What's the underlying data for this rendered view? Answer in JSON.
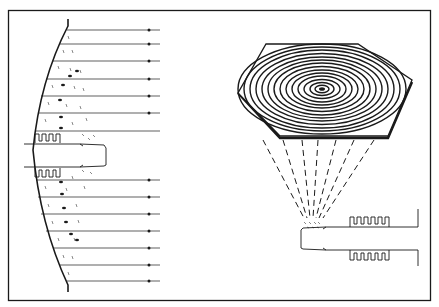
{
  "figure": {
    "type": "technical-illustration",
    "colors": {
      "ink": "#1a1a1a",
      "background": "#ffffff"
    },
    "left_panel": {
      "parallel_ray_count_upper": 7,
      "parallel_ray_count_lower": 7,
      "feed": "corrugated horn with waveguide"
    },
    "right_panel": {
      "plate_shape": "hexagon",
      "pattern": "concentric spiral",
      "dashed_ray_count": 7,
      "feed": "corrugated horn with waveguide"
    }
  }
}
